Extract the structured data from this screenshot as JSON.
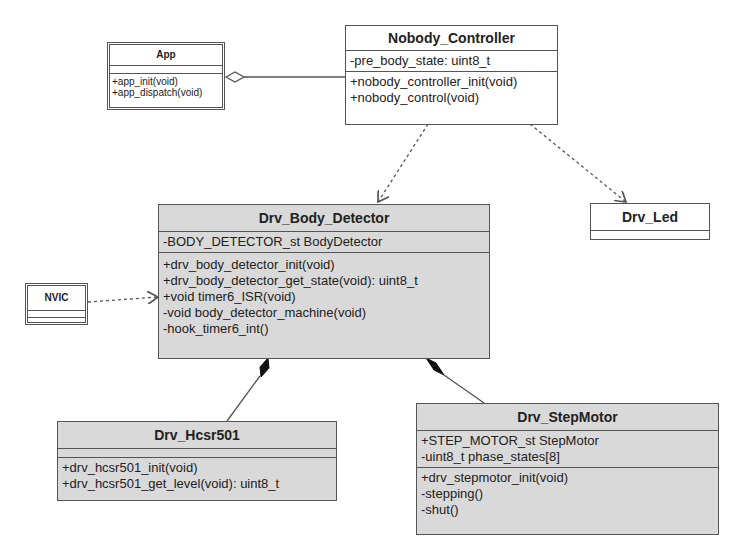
{
  "diagram": {
    "type": "UML class diagram",
    "classes": {
      "app": {
        "name": "App",
        "attributes": [],
        "methods": [
          "+app_init(void)",
          "+app_dispatch(void)"
        ]
      },
      "nobody_controller": {
        "name": "Nobody_Controller",
        "attributes": [
          "-pre_body_state: uint8_t"
        ],
        "methods": [
          "+nobody_controller_init(void)",
          "+nobody_control(void)"
        ]
      },
      "drv_body_detector": {
        "name": "Drv_Body_Detector",
        "attributes": [
          "-BODY_DETECTOR_st BodyDetector"
        ],
        "methods": [
          "+drv_body_detector_init(void)",
          "+drv_body_detector_get_state(void): uint8_t",
          "+void timer6_ISR(void)",
          "-void body_detector_machine(void)",
          "-hook_timer6_int()"
        ]
      },
      "drv_led": {
        "name": "Drv_Led",
        "attributes": [],
        "methods": []
      },
      "nvic": {
        "name": "NVIC",
        "attributes": [],
        "methods": []
      },
      "drv_hcsr501": {
        "name": "Drv_Hcsr501",
        "attributes": [],
        "methods": [
          "+drv_hcsr501_init(void)",
          "+drv_hcsr501_get_level(void): uint8_t"
        ]
      },
      "drv_stepmotor": {
        "name": "Drv_StepMotor",
        "attributes": [
          "+STEP_MOTOR_st StepMotor",
          "-uint8_t phase_states[8]"
        ],
        "methods": [
          "+drv_stepmotor_init(void)",
          "-stepping()",
          "-shut()"
        ]
      }
    },
    "relationships": [
      {
        "from": "App",
        "to": "Nobody_Controller",
        "type": "aggregation"
      },
      {
        "from": "Nobody_Controller",
        "to": "Drv_Body_Detector",
        "type": "dependency"
      },
      {
        "from": "Nobody_Controller",
        "to": "Drv_Led",
        "type": "dependency"
      },
      {
        "from": "NVIC",
        "to": "Drv_Body_Detector",
        "type": "dependency"
      },
      {
        "from": "Drv_Body_Detector",
        "to": "Drv_Hcsr501",
        "type": "composition"
      },
      {
        "from": "Drv_Body_Detector",
        "to": "Drv_StepMotor",
        "type": "composition"
      }
    ],
    "colors": {
      "grey_fill": "#d9d9d9",
      "white_fill": "#ffffff",
      "line": "#555555"
    }
  }
}
